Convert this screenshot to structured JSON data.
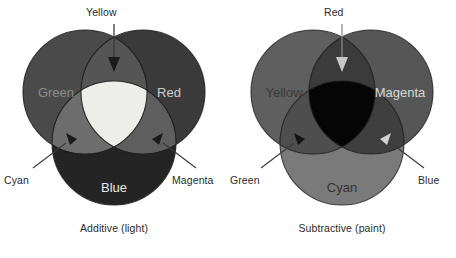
{
  "figure": {
    "background_color": "#ffffff",
    "text_color": "#2b2b2b"
  },
  "panels": [
    {
      "id": "additive",
      "caption": "Additive (light)",
      "primaries": [
        {
          "name": "Green",
          "label": "Green",
          "position": "top-left",
          "color": "#4a4a4a",
          "label_color": "#8c8c8c"
        },
        {
          "name": "Red",
          "label": "Red",
          "position": "top-right",
          "color": "#3a3a3a",
          "label_color": "#cfcfcf"
        },
        {
          "name": "Blue",
          "label": "Blue",
          "position": "bottom",
          "color": "#242424",
          "label_color": "#e8e8e8"
        }
      ],
      "secondaries": [
        {
          "name": "Yellow",
          "label": "Yellow",
          "mix": "Green + Red",
          "color": "#555555",
          "callout": "top",
          "arrow_color": "#1a1a1a"
        },
        {
          "name": "Cyan",
          "label": "Cyan",
          "mix": "Green + Blue",
          "color": "#6d6d6d",
          "callout": "bottom-left",
          "arrow_color": "#1a1a1a"
        },
        {
          "name": "Magenta",
          "label": "Magenta",
          "mix": "Red + Blue",
          "color": "#5e5e5e",
          "callout": "bottom-right",
          "arrow_color": "#1a1a1a"
        }
      ],
      "center": {
        "name": "White",
        "label": "",
        "color": "#ededea"
      }
    },
    {
      "id": "subtractive",
      "caption": "Subtractive (paint)",
      "primaries": [
        {
          "name": "Yellow",
          "label": "Yellow",
          "position": "top-left",
          "color": "#5f5f5f",
          "label_color": "#3a3a3a"
        },
        {
          "name": "Magenta",
          "label": "Magenta",
          "position": "top-right",
          "color": "#565656",
          "label_color": "#d8d8d8"
        },
        {
          "name": "Cyan",
          "label": "Cyan",
          "position": "bottom",
          "color": "#7a7a7a",
          "label_color": "#343434"
        }
      ],
      "secondaries": [
        {
          "name": "Red",
          "label": "Red",
          "mix": "Yellow + Magenta",
          "color": "#3b3b3b",
          "callout": "top",
          "arrow_color": "#c8c8c8"
        },
        {
          "name": "Green",
          "label": "Green",
          "mix": "Yellow + Cyan",
          "color": "#4e4e4e",
          "callout": "bottom-left",
          "arrow_color": "#141414"
        },
        {
          "name": "Blue",
          "label": "Blue",
          "mix": "Magenta + Cyan",
          "color": "#3f3f3f",
          "callout": "bottom-right",
          "arrow_color": "#d2d2d2"
        }
      ],
      "center": {
        "name": "Black",
        "label": "",
        "color": "#050505"
      }
    }
  ],
  "callout_labels": {
    "additive": {
      "top": "Yellow",
      "bottom_left": "Cyan",
      "bottom_right": "Magenta"
    },
    "subtractive": {
      "top": "Red",
      "bottom_left": "Green",
      "bottom_right": "Blue"
    }
  },
  "captions": {
    "additive": "Additive (light)",
    "subtractive": "Subtractive (paint)"
  }
}
